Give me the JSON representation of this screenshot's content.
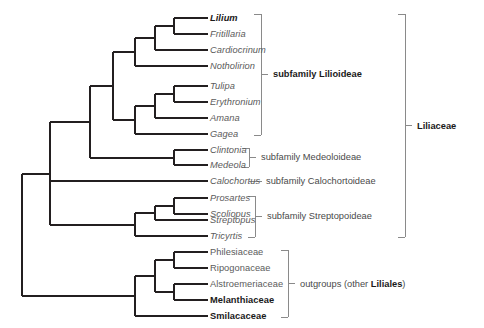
{
  "figure": {
    "background_color": "#ffffff",
    "line_color": "#231f20",
    "bracket_color": "#8a8a8a",
    "text_color_regular": "#5b5b5b",
    "text_color_bold": "#1a1a1a"
  },
  "tips": [
    {
      "id": "lilium",
      "label": "Lilium",
      "style": "genus-bold",
      "x": 210,
      "y": 18,
      "branch_x": 174
    },
    {
      "id": "fritillaria",
      "label": "Fritillaria",
      "style": "genus",
      "x": 210,
      "y": 34,
      "branch_x": 174
    },
    {
      "id": "cardiocrinum",
      "label": "Cardiocrinum",
      "style": "genus",
      "x": 210,
      "y": 50,
      "branch_x": 155
    },
    {
      "id": "notholirion",
      "label": "Notholirion",
      "style": "genus",
      "x": 210,
      "y": 66,
      "branch_x": 135
    },
    {
      "id": "tulipa",
      "label": "Tulipa",
      "style": "genus",
      "x": 210,
      "y": 86,
      "branch_x": 174
    },
    {
      "id": "erythronium",
      "label": "Erythronium",
      "style": "genus",
      "x": 210,
      "y": 102,
      "branch_x": 174
    },
    {
      "id": "amana",
      "label": "Amana",
      "style": "genus",
      "x": 210,
      "y": 118,
      "branch_x": 155
    },
    {
      "id": "gagea",
      "label": "Gagea",
      "style": "genus",
      "x": 210,
      "y": 134,
      "branch_x": 135
    },
    {
      "id": "clintonia",
      "label": "Clintonia",
      "style": "genus",
      "x": 210,
      "y": 150,
      "branch_x": 174
    },
    {
      "id": "medeola",
      "label": "Medeola",
      "style": "genus",
      "x": 210,
      "y": 165,
      "branch_x": 174
    },
    {
      "id": "calochortus",
      "label": "Calochortus",
      "style": "genus",
      "x": 210,
      "y": 181,
      "branch_x": 98
    },
    {
      "id": "prosartes",
      "label": "Prosartes",
      "style": "genus",
      "x": 210,
      "y": 198,
      "branch_x": 174
    },
    {
      "id": "scoliopus",
      "label": "Scoliopus",
      "style": "genus",
      "x": 210,
      "y": 214,
      "branch_x": 174
    },
    {
      "id": "streptopus",
      "label": "Streptopus",
      "style": "genus",
      "x": 210,
      "y": 220,
      "branch_x": 155
    },
    {
      "id": "tricyrtis",
      "label": "Tricyrtis",
      "style": "genus",
      "x": 210,
      "y": 236,
      "branch_x": 135
    },
    {
      "id": "philesiaceae",
      "label": "Philesiaceae",
      "style": "family",
      "x": 210,
      "y": 252,
      "branch_x": 174
    },
    {
      "id": "ripogonaceae",
      "label": "Ripogonaceae",
      "style": "family",
      "x": 210,
      "y": 268,
      "branch_x": 174
    },
    {
      "id": "alstroemeriaceae",
      "label": "Alstroemeriaceae",
      "style": "family",
      "x": 210,
      "y": 284,
      "branch_x": 174
    },
    {
      "id": "melanthiaceae",
      "label": "Melanthiaceae",
      "style": "family-bold",
      "x": 210,
      "y": 300,
      "branch_x": 174
    },
    {
      "id": "smilacaceae",
      "label": "Smilacaceae",
      "style": "family-bold",
      "x": 210,
      "y": 316,
      "branch_x": 135
    }
  ],
  "annotations": [
    {
      "id": "subfamily-lilioideae",
      "label": "subfamily Lilioideae",
      "bold": true,
      "bracket": {
        "x": 261,
        "y_top": 14,
        "y_bottom": 135,
        "tick_len": 7
      },
      "text_x": 273,
      "text_y": 74
    },
    {
      "id": "subfamily-medeoloideae",
      "label": "subfamily Medeoloideae",
      "bold": false,
      "bracket": {
        "x": 249,
        "y_top": 148,
        "y_bottom": 167,
        "tick_len": 7
      },
      "text_x": 261,
      "text_y": 157
    },
    {
      "id": "subfamily-calochortoideae",
      "label": "subfamily Calochortoideae",
      "bold": false,
      "dash": {
        "x1": 249,
        "x2": 262,
        "y": 181
      },
      "text_x": 266,
      "text_y": 181
    },
    {
      "id": "subfamily-streptopoideae",
      "label": "subfamily Streptopoideae",
      "bold": false,
      "bracket": {
        "x": 255,
        "y_top": 196,
        "y_bottom": 237,
        "tick_len": 7
      },
      "text_x": 267,
      "text_y": 216
    },
    {
      "id": "outgroups",
      "label": "outgroups (other Liliales)",
      "bold_segment": "Liliales",
      "bold": false,
      "bracket": {
        "x": 288,
        "y_top": 250,
        "y_bottom": 317,
        "tick_len": 7
      },
      "text_x": 300,
      "text_y": 284
    },
    {
      "id": "liliaceae",
      "label": "Liliaceae",
      "bold": true,
      "bracket": {
        "x": 405,
        "y_top": 14,
        "y_bottom": 237,
        "tick_len": 7
      },
      "text_x": 417,
      "text_y": 126
    }
  ],
  "tree_edges": {
    "description": "Cladogram branch segments in pixel coordinates",
    "segments": [
      {
        "type": "h",
        "x1": 174,
        "x2": 208,
        "y": 18
      },
      {
        "type": "h",
        "x1": 174,
        "x2": 208,
        "y": 34
      },
      {
        "type": "v",
        "x": 174,
        "y1": 18,
        "y2": 34
      },
      {
        "type": "h",
        "x1": 155,
        "x2": 174,
        "y": 26
      },
      {
        "type": "h",
        "x1": 155,
        "x2": 208,
        "y": 50
      },
      {
        "type": "v",
        "x": 155,
        "y1": 26,
        "y2": 50
      },
      {
        "type": "h",
        "x1": 135,
        "x2": 155,
        "y": 38
      },
      {
        "type": "h",
        "x1": 135,
        "x2": 208,
        "y": 66
      },
      {
        "type": "v",
        "x": 135,
        "y1": 38,
        "y2": 66
      },
      {
        "type": "h",
        "x1": 113,
        "x2": 135,
        "y": 52
      },
      {
        "type": "h",
        "x1": 174,
        "x2": 208,
        "y": 86
      },
      {
        "type": "h",
        "x1": 174,
        "x2": 208,
        "y": 102
      },
      {
        "type": "v",
        "x": 174,
        "y1": 86,
        "y2": 102
      },
      {
        "type": "h",
        "x1": 155,
        "x2": 174,
        "y": 94
      },
      {
        "type": "h",
        "x1": 155,
        "x2": 208,
        "y": 118
      },
      {
        "type": "v",
        "x": 155,
        "y1": 94,
        "y2": 118
      },
      {
        "type": "h",
        "x1": 135,
        "x2": 155,
        "y": 106
      },
      {
        "type": "h",
        "x1": 135,
        "x2": 208,
        "y": 134
      },
      {
        "type": "v",
        "x": 135,
        "y1": 106,
        "y2": 134
      },
      {
        "type": "h",
        "x1": 113,
        "x2": 135,
        "y": 120
      },
      {
        "type": "v",
        "x": 113,
        "y1": 52,
        "y2": 120
      },
      {
        "type": "h",
        "x1": 90,
        "x2": 113,
        "y": 86
      },
      {
        "type": "h",
        "x1": 174,
        "x2": 208,
        "y": 150
      },
      {
        "type": "h",
        "x1": 174,
        "x2": 208,
        "y": 165
      },
      {
        "type": "v",
        "x": 174,
        "y1": 150,
        "y2": 165
      },
      {
        "type": "h",
        "x1": 90,
        "x2": 174,
        "y": 158
      },
      {
        "type": "v",
        "x": 90,
        "y1": 86,
        "y2": 158
      },
      {
        "type": "h",
        "x1": 50,
        "x2": 90,
        "y": 122
      },
      {
        "type": "h",
        "x1": 50,
        "x2": 208,
        "y": 181
      },
      {
        "type": "h",
        "x1": 174,
        "x2": 208,
        "y": 198
      },
      {
        "type": "h",
        "x1": 174,
        "x2": 208,
        "y": 214
      },
      {
        "type": "v",
        "x": 174,
        "y1": 198,
        "y2": 214
      },
      {
        "type": "h",
        "x1": 155,
        "x2": 174,
        "y": 206
      },
      {
        "type": "h",
        "x1": 155,
        "x2": 208,
        "y": 220
      },
      {
        "type": "v",
        "x": 155,
        "y1": 206,
        "y2": 220
      },
      {
        "type": "h",
        "x1": 135,
        "x2": 155,
        "y": 213
      },
      {
        "type": "h",
        "x1": 135,
        "x2": 208,
        "y": 236
      },
      {
        "type": "v",
        "x": 135,
        "y1": 213,
        "y2": 236
      },
      {
        "type": "h",
        "x1": 50,
        "x2": 135,
        "y": 225
      },
      {
        "type": "v",
        "x": 50,
        "y1": 122,
        "y2": 225
      },
      {
        "type": "h",
        "x1": 22,
        "x2": 50,
        "y": 174
      },
      {
        "type": "h",
        "x1": 174,
        "x2": 208,
        "y": 252
      },
      {
        "type": "h",
        "x1": 174,
        "x2": 208,
        "y": 268
      },
      {
        "type": "v",
        "x": 174,
        "y1": 252,
        "y2": 268
      },
      {
        "type": "h",
        "x1": 155,
        "x2": 174,
        "y": 260
      },
      {
        "type": "h",
        "x1": 174,
        "x2": 208,
        "y": 284
      },
      {
        "type": "h",
        "x1": 174,
        "x2": 208,
        "y": 300
      },
      {
        "type": "v",
        "x": 174,
        "y1": 284,
        "y2": 300
      },
      {
        "type": "h",
        "x1": 155,
        "x2": 174,
        "y": 292
      },
      {
        "type": "v",
        "x": 155,
        "y1": 260,
        "y2": 292
      },
      {
        "type": "h",
        "x1": 135,
        "x2": 155,
        "y": 276
      },
      {
        "type": "h",
        "x1": 135,
        "x2": 208,
        "y": 316
      },
      {
        "type": "v",
        "x": 135,
        "y1": 276,
        "y2": 316
      },
      {
        "type": "h",
        "x1": 22,
        "x2": 135,
        "y": 296
      },
      {
        "type": "v",
        "x": 22,
        "y1": 174,
        "y2": 296
      }
    ]
  }
}
